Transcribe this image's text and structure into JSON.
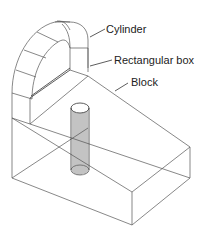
{
  "figure": {
    "type": "isometric wireframe drawing",
    "line_color": "#555555",
    "background": "#ffffff"
  },
  "labels": {
    "cylinder": "Cylinder",
    "rectangular_box": "Rectangular box",
    "block": "Block"
  },
  "parts": [
    {
      "name": "Cylinder",
      "description": "half-cylinder on top"
    },
    {
      "name": "Rectangular box",
      "description": "box beneath cylinder"
    },
    {
      "name": "Block",
      "description": "sloped base block"
    },
    {
      "name": "Hole",
      "description": "vertical cylindrical hole"
    }
  ]
}
